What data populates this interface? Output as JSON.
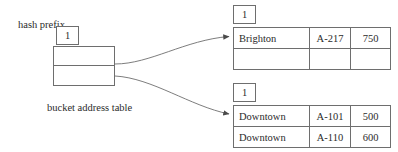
{
  "diagram": {
    "labels": {
      "hash_prefix": "hash prefix",
      "bucket_address_table": "bucket address table"
    },
    "bucket_address_table": {
      "prefix": "1",
      "entries": [
        "",
        ""
      ]
    },
    "buckets": [
      {
        "id": "bucket-1",
        "prefix": "1",
        "rows": [
          {
            "branch": "Brighton",
            "account": "A-217",
            "balance": "750"
          },
          {
            "branch": "",
            "account": "",
            "balance": ""
          }
        ]
      },
      {
        "id": "bucket-2",
        "prefix": "1",
        "rows": [
          {
            "branch": "Downtown",
            "account": "A-101",
            "balance": "500"
          },
          {
            "branch": "Downtown",
            "account": "A-110",
            "balance": "600"
          }
        ]
      }
    ],
    "connectors": [
      {
        "name": "pointer-to-bucket-1",
        "from": "bucket-address-table-row-1",
        "to": "bucket-1"
      },
      {
        "name": "pointer-to-bucket-2",
        "from": "bucket-address-table-row-2",
        "to": "bucket-2"
      }
    ],
    "colors": {
      "line": "#6e6e6e",
      "text": "#2b2b2b",
      "background": "#ffffff"
    }
  }
}
